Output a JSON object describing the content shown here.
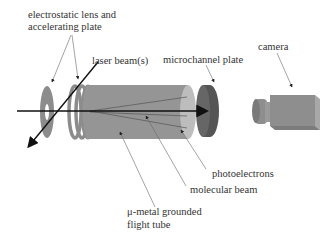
{
  "diagram": {
    "labels": {
      "lens": [
        "electrostatic lens and",
        "accelerating plate"
      ],
      "laser": "laser beam(s)",
      "mcp": "microchannel plate",
      "camera": "camera",
      "photoelectrons": "photoelectrons",
      "molecular_beam": "molecular beam",
      "tube": [
        "μ-metal grounded",
        "flight tube"
      ]
    },
    "colors": {
      "component_gray": "#8c8c8c",
      "tube_gray": "#959595",
      "tube_end": "#bdbdbd",
      "mcp_dark": "#555555",
      "camera_gray": "#8e8e8e",
      "beam": "#111111",
      "leader": "#555555"
    }
  }
}
